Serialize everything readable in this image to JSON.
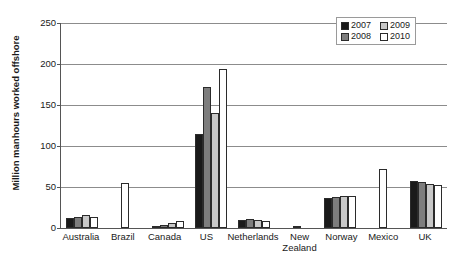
{
  "chart_data": {
    "type": "bar",
    "title": "",
    "xlabel": "",
    "ylabel": "Million manhours worked offshore",
    "ylim": [
      0,
      250
    ],
    "yticks": [
      0,
      50,
      100,
      150,
      200,
      250
    ],
    "grid": true,
    "legend_position": "top-right",
    "categories": [
      "Australia",
      "Brazil",
      "Canada",
      "US",
      "Netherlands",
      "New\nZealand",
      "Norway",
      "Mexico",
      "UK"
    ],
    "series": [
      {
        "name": "2007",
        "color": "#1a1a1a",
        "values": [
          12,
          null,
          3,
          115,
          10,
          null,
          36,
          null,
          57
        ]
      },
      {
        "name": "2008",
        "color": "#7d7d7d",
        "values": [
          14,
          null,
          4,
          172,
          11,
          null,
          38,
          null,
          56
        ]
      },
      {
        "name": "2009",
        "color": "#c8c8c8",
        "values": [
          16,
          null,
          6,
          140,
          10,
          null,
          39,
          null,
          54
        ]
      },
      {
        "name": "2010",
        "color": "#ffffff",
        "values": [
          14,
          55,
          8,
          194,
          9,
          3,
          39,
          72,
          52
        ]
      }
    ]
  },
  "legend": {
    "items": [
      {
        "label": "2007",
        "color": "#1a1a1a"
      },
      {
        "label": "2009",
        "color": "#c8c8c8"
      },
      {
        "label": "2008",
        "color": "#7d7d7d"
      },
      {
        "label": "2010",
        "color": "#ffffff"
      }
    ]
  }
}
